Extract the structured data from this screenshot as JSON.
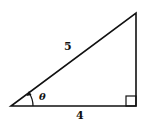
{
  "diagram": {
    "type": "right-triangle",
    "hypotenuse_label": "5",
    "base_label": "4",
    "angle_label": "θ",
    "vertices": {
      "bottom_left": [
        11,
        106
      ],
      "bottom_right": [
        136,
        106
      ],
      "top_right": [
        136,
        13
      ]
    },
    "colors": {
      "stroke": "#111111",
      "background": "#ffffff"
    }
  }
}
